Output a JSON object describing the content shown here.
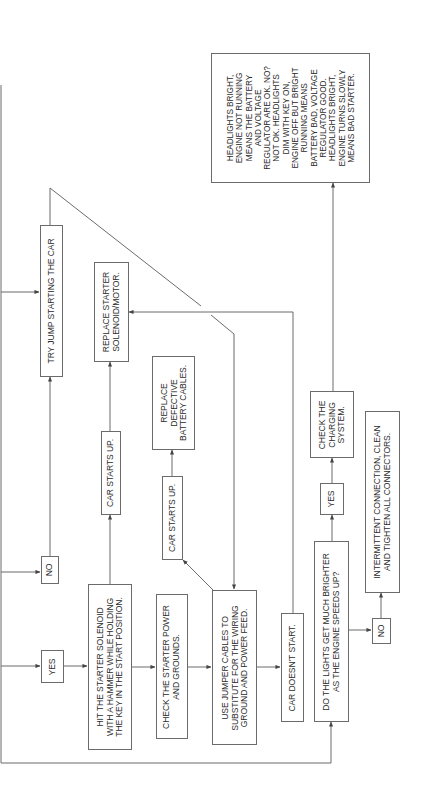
{
  "diagram": {
    "orientation": "rotated-90-ccw",
    "line_color": "#6b6b6b",
    "text_color": "#2b2b2b",
    "nodes": {
      "headlights_note": {
        "label": "HEADLIGHTS BRIGHT,\nENGINE NOT RUNNING\nMEANS THE BATTERY\nAND VOLTAGE\nREGULATOR ARE OK. NO?\nNOT OK. HEADLIGHTS\nDIM WITH KEY ON,\nENGINE OFF BUT BRIGHT\nRUNNING MEANS\nBATTERY BAD, VOLTAGE\nREGULATOR GOOD.\nHEADLIGHTS BRIGHT,\nENGINE TURNS SLOWLY\nMEANS BAD STARTER."
      },
      "try_jump": {
        "label": "TRY JUMP STARTING THE CAR"
      },
      "replace_starter": {
        "label": "REPLACE STARTER\nSOLENOID/MOTOR."
      },
      "replace_cables": {
        "label": "REPLACE\nDEFECTIVE\nBATTERY CABLES."
      },
      "no_top": {
        "label": "NO"
      },
      "car_starts_1": {
        "label": "CAR STARTS UP."
      },
      "car_starts_2": {
        "label": "CAR STARTS UP."
      },
      "check_charging": {
        "label": "CHECK THE\nCHARGING\nSYSTEM."
      },
      "yes_charging": {
        "label": "YES"
      },
      "intermittent": {
        "label": "INTERMITTENT CONNECTION, CLEAN\nAND TIGHTEN ALL CONNECTORS."
      },
      "yes_left": {
        "label": "YES"
      },
      "hit_solenoid": {
        "label": "HIT THE STARTER SOLENOID\nWITH A HAMMER WHILE HOLDING\nTHE KEY IN THE START POSITION."
      },
      "check_starter_power": {
        "label": "CHECK THE STARTER POWER\nAND GROUNDS."
      },
      "use_jumper": {
        "label": "USE JUMPER CABLES TO\nSUBSTITUTE FOR THE WIRING\nGROUND AND POWER FEED."
      },
      "car_doesnt_start": {
        "label": "CAR DOESN'T START."
      },
      "lights_brighter": {
        "label": "DO THE LIGHTS GET MUCH BRIGHTER\nAS THE ENGINE SPEEDS UP?"
      },
      "no_bottom": {
        "label": "NO"
      }
    }
  }
}
